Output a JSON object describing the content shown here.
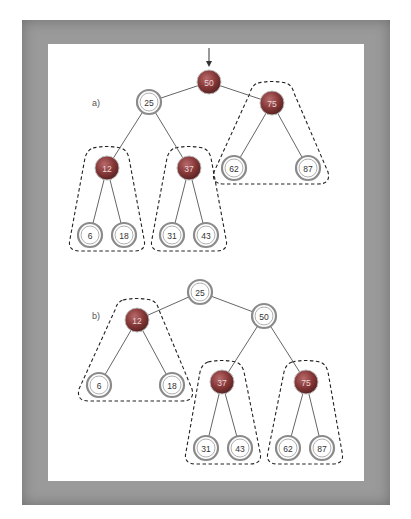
{
  "figure": {
    "frame_color": "#9a9a9a",
    "background": "#ffffff",
    "edge_color": "#666666",
    "dashed_outline_color": "#222222",
    "red_node_color": "#8a3a3a",
    "black_node_ring_color": "#8a8a8a"
  },
  "panel_a": {
    "label": "a)",
    "root_arrow": true,
    "nodes": [
      {
        "id": "a50",
        "value": "50",
        "color": "red",
        "x": 209,
        "y": 82
      },
      {
        "id": "a25",
        "value": "25",
        "color": "white",
        "x": 149,
        "y": 102
      },
      {
        "id": "a75",
        "value": "75",
        "color": "red",
        "x": 272,
        "y": 103
      },
      {
        "id": "a12",
        "value": "12",
        "color": "red",
        "x": 107,
        "y": 168
      },
      {
        "id": "a37",
        "value": "37",
        "color": "red",
        "x": 189,
        "y": 168
      },
      {
        "id": "a62",
        "value": "62",
        "color": "white",
        "x": 234,
        "y": 168
      },
      {
        "id": "a87",
        "value": "87",
        "color": "white",
        "x": 308,
        "y": 168
      },
      {
        "id": "a6",
        "value": "6",
        "color": "white",
        "x": 90,
        "y": 235
      },
      {
        "id": "a18",
        "value": "18",
        "color": "white",
        "x": 124,
        "y": 235
      },
      {
        "id": "a31",
        "value": "31",
        "color": "white",
        "x": 172,
        "y": 235
      },
      {
        "id": "a43",
        "value": "43",
        "color": "white",
        "x": 206,
        "y": 235
      }
    ],
    "edges": [
      [
        "a50",
        "a25"
      ],
      [
        "a50",
        "a75"
      ],
      [
        "a25",
        "a12"
      ],
      [
        "a25",
        "a37"
      ],
      [
        "a75",
        "a62"
      ],
      [
        "a75",
        "a87"
      ],
      [
        "a12",
        "a6"
      ],
      [
        "a12",
        "a18"
      ],
      [
        "a37",
        "a31"
      ],
      [
        "a37",
        "a43"
      ]
    ],
    "groups": [
      [
        "a12",
        "a6",
        "a18"
      ],
      [
        "a37",
        "a31",
        "a43"
      ],
      [
        "a75",
        "a62",
        "a87"
      ]
    ]
  },
  "panel_b": {
    "label": "b)",
    "nodes": [
      {
        "id": "b25",
        "value": "25",
        "color": "white",
        "x": 200,
        "y": 292
      },
      {
        "id": "b12",
        "value": "12",
        "color": "red",
        "x": 137,
        "y": 320
      },
      {
        "id": "b50",
        "value": "50",
        "color": "white",
        "x": 264,
        "y": 316
      },
      {
        "id": "b6",
        "value": "6",
        "color": "white",
        "x": 99,
        "y": 385
      },
      {
        "id": "b18",
        "value": "18",
        "color": "white",
        "x": 172,
        "y": 385
      },
      {
        "id": "b37",
        "value": "37",
        "color": "red",
        "x": 222,
        "y": 382
      },
      {
        "id": "b75",
        "value": "75",
        "color": "red",
        "x": 306,
        "y": 382
      },
      {
        "id": "b31",
        "value": "31",
        "color": "white",
        "x": 206,
        "y": 448
      },
      {
        "id": "b43",
        "value": "43",
        "color": "white",
        "x": 240,
        "y": 448
      },
      {
        "id": "b62",
        "value": "62",
        "color": "white",
        "x": 288,
        "y": 448
      },
      {
        "id": "b87",
        "value": "87",
        "color": "white",
        "x": 322,
        "y": 448
      }
    ],
    "edges": [
      [
        "b25",
        "b12"
      ],
      [
        "b25",
        "b50"
      ],
      [
        "b12",
        "b6"
      ],
      [
        "b12",
        "b18"
      ],
      [
        "b50",
        "b37"
      ],
      [
        "b50",
        "b75"
      ],
      [
        "b37",
        "b31"
      ],
      [
        "b37",
        "b43"
      ],
      [
        "b75",
        "b62"
      ],
      [
        "b75",
        "b87"
      ]
    ],
    "groups": [
      [
        "b12",
        "b6",
        "b18"
      ],
      [
        "b37",
        "b31",
        "b43"
      ],
      [
        "b75",
        "b62",
        "b87"
      ]
    ]
  }
}
